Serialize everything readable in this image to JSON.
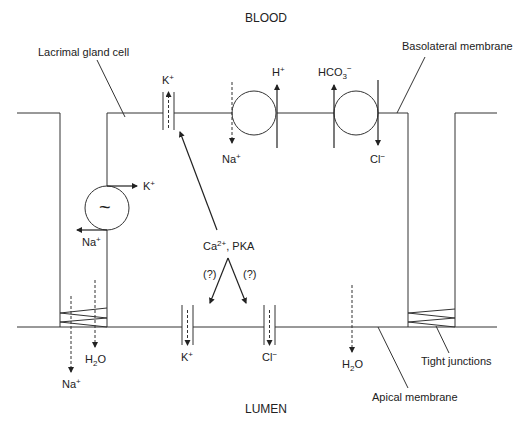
{
  "diagram": {
    "regions": {
      "top": "BLOOD",
      "bottom": "LUMEN"
    },
    "labels": {
      "cell": "Lacrimal gland cell",
      "basolateral": "Basolateral membrane",
      "apical": "Apical membrane",
      "tight_junctions": "Tight junctions",
      "regulator": "Ca2+, PKA",
      "regulator_base": "Ca",
      "regulator_sup": "2+",
      "regulator_rest": ", PKA",
      "uncertain_left": "(?)",
      "uncertain_right": "(?)",
      "pump_symbol": "~"
    },
    "ions": {
      "baso_k_channel": {
        "base": "K",
        "sup": "+"
      },
      "baso_na_in": {
        "base": "Na",
        "sup": "+"
      },
      "baso_h_out": {
        "base": "H",
        "sup": "+"
      },
      "baso_hco3_out": {
        "base": "HCO",
        "sub": "3",
        "sup": "−"
      },
      "baso_cl_in": {
        "base": "Cl",
        "sup": "−"
      },
      "pump_k": {
        "base": "K",
        "sup": "+"
      },
      "pump_na": {
        "base": "Na",
        "sup": "+"
      },
      "apical_k": {
        "base": "K",
        "sup": "+"
      },
      "apical_cl": {
        "base": "Cl",
        "sup": "−"
      },
      "apical_h2o": {
        "base": "H",
        "sub": "2",
        "rest": "O"
      },
      "paracellular_h2o": {
        "base": "H",
        "sub": "2",
        "rest": "O"
      },
      "paracellular_na": {
        "base": "Na",
        "sup": "+"
      }
    },
    "transporters": [
      {
        "name": "K+ channel (basolateral)",
        "type": "channel"
      },
      {
        "name": "Na+/H+ exchanger",
        "type": "exchanger"
      },
      {
        "name": "Cl-/HCO3- exchanger",
        "type": "exchanger"
      },
      {
        "name": "Na+/K+ ATPase",
        "type": "pump"
      },
      {
        "name": "K+ channel (apical)",
        "type": "channel"
      },
      {
        "name": "Cl- channel (apical)",
        "type": "channel"
      }
    ]
  }
}
